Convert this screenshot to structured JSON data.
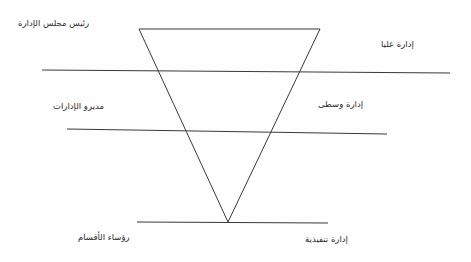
{
  "diagram": {
    "type": "inverted-triangle-management-pyramid",
    "title": "",
    "background_color": "#fefefe",
    "stroke_color": "#3a3a3a",
    "text_color": "#2b2b2b",
    "labels": {
      "top_left": "رئيس مجلس الإدارة",
      "top_right": "إدارة عليا",
      "middle_left": "مديرو الإدارات",
      "middle_right": "إدارة وسطى",
      "bottom_left": "رؤساء الأقسام",
      "bottom_right": "إدارة تنفيذية"
    },
    "shapes": {
      "triangle": {
        "apex_x": 228,
        "apex_y": 222,
        "top_left_x": 139,
        "top_left_y": 29,
        "top_right_x": 320,
        "top_right_y": 29
      },
      "divider_lines": [
        {
          "x1": 42,
          "y1": 70,
          "x2": 450,
          "y2": 73
        },
        {
          "x1": 67,
          "y1": 129,
          "x2": 387,
          "y2": 134
        },
        {
          "x1": 137,
          "y1": 222,
          "x2": 328,
          "y2": 223
        }
      ]
    }
  }
}
